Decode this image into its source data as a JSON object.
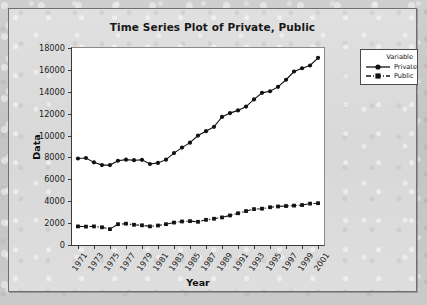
{
  "title": "Time Series Plot of Private, Public",
  "legend": {
    "header": "Variable",
    "entries": [
      {
        "label": "Private",
        "marker": "circle",
        "dash": "solid",
        "color": "#111111"
      },
      {
        "label": "Public",
        "marker": "square",
        "dash": "dash-dot",
        "color": "#111111"
      }
    ]
  },
  "chart_data": {
    "type": "line",
    "title": "Time Series Plot of Private, Public",
    "xlabel": "Year",
    "ylabel": "Data",
    "xlim": [
      1971,
      2001
    ],
    "ylim": [
      0,
      18000
    ],
    "ytick_step": 2000,
    "yticks": [
      0,
      2000,
      4000,
      6000,
      8000,
      10000,
      12000,
      14000,
      16000,
      18000
    ],
    "xticks": [
      1971,
      1973,
      1975,
      1977,
      1979,
      1981,
      1983,
      1985,
      1987,
      1989,
      1991,
      1993,
      1995,
      1997,
      1999,
      2001
    ],
    "x": [
      1971,
      1972,
      1973,
      1974,
      1975,
      1976,
      1977,
      1978,
      1979,
      1980,
      1981,
      1982,
      1983,
      1984,
      1985,
      1986,
      1987,
      1988,
      1989,
      1990,
      1991,
      1992,
      1993,
      1994,
      1995,
      1996,
      1997,
      1998,
      1999,
      2000,
      2001
    ],
    "grid": false,
    "legend_position": "right",
    "series": [
      {
        "name": "Private",
        "marker": "circle",
        "dash": "solid",
        "color": "#111111",
        "values": [
          7900,
          7950,
          7550,
          7300,
          7300,
          7700,
          7800,
          7750,
          7780,
          7400,
          7500,
          7800,
          8400,
          8900,
          9350,
          10000,
          10400,
          10800,
          11700,
          12050,
          12300,
          12650,
          13300,
          13900,
          14050,
          14450,
          15100,
          15850,
          16150,
          16400,
          17100
        ]
      },
      {
        "name": "Public",
        "marker": "square",
        "dash": "dash-dot",
        "color": "#111111",
        "values": [
          1700,
          1680,
          1700,
          1620,
          1450,
          1900,
          1950,
          1850,
          1800,
          1700,
          1780,
          1900,
          2050,
          2150,
          2180,
          2120,
          2300,
          2400,
          2520,
          2700,
          2900,
          3100,
          3280,
          3320,
          3450,
          3520,
          3560,
          3600,
          3650,
          3780,
          3820
        ]
      }
    ]
  }
}
